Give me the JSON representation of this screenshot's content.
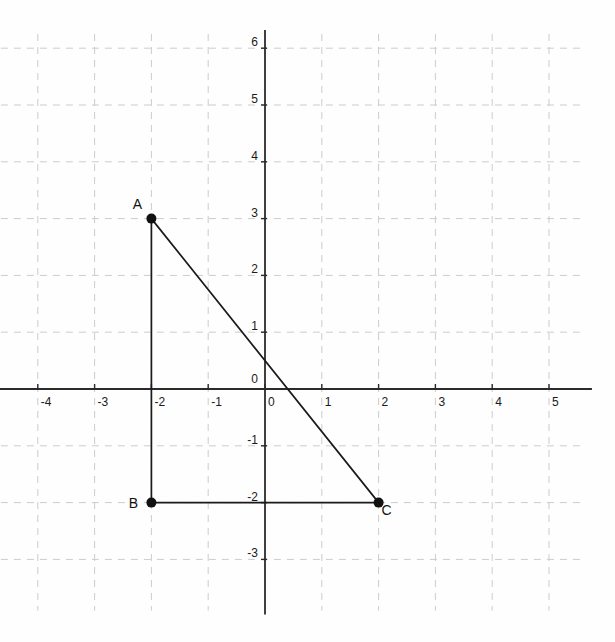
{
  "figure": {
    "background_color": "#fefefe",
    "axis_color": "#2b2b2b",
    "grid_color": "#cccccc",
    "segment_color": "#1a1a1a",
    "point_color": "#111111",
    "label_color": "#111111"
  },
  "chart_data": {
    "type": "scatter",
    "title": "",
    "xlabel": "",
    "ylabel": "",
    "xlim": [
      -4.65,
      5.65
    ],
    "ylim": [
      -3.9,
      6.25
    ],
    "grid": true,
    "grid_style": "dashed",
    "legend": "none",
    "x_ticks": [
      -4,
      -3,
      -2,
      -1,
      0,
      1,
      2,
      3,
      4,
      5
    ],
    "x_tick_labels": [
      "-4",
      "-3",
      "-2",
      "-1",
      "0",
      "1",
      "2",
      "3",
      "4",
      "5"
    ],
    "y_ticks": [
      -3,
      -2,
      -1,
      0,
      1,
      2,
      3,
      4,
      5,
      6
    ],
    "y_tick_labels": [
      "-3",
      "-2",
      "-1",
      "0",
      "1",
      "2",
      "3",
      "4",
      "5",
      "6"
    ],
    "points": [
      {
        "label": "A",
        "x": -2,
        "y": 3,
        "label_dx": -14,
        "label_dy": -10
      },
      {
        "label": "B",
        "x": -2,
        "y": -2,
        "label_dx": -18,
        "label_dy": 5
      },
      {
        "label": "C",
        "x": 2,
        "y": -2,
        "label_dx": 8,
        "label_dy": 12
      }
    ],
    "segments": [
      {
        "name": "AB",
        "from": "A",
        "to": "B"
      },
      {
        "name": "BC",
        "from": "B",
        "to": "C"
      },
      {
        "name": "AC",
        "from": "A",
        "to": "C"
      }
    ],
    "shape": "right triangle"
  }
}
